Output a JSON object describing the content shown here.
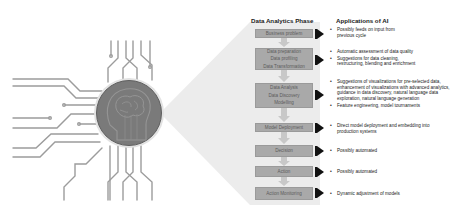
{
  "headers": {
    "phase": "Data Analytics Phase",
    "applications": "Applications of AI"
  },
  "phases": [
    {
      "lines": [
        "Business problem"
      ],
      "applications": [
        "Possibly feeds on input from previous cycle"
      ]
    },
    {
      "lines": [
        "Data preparation",
        "Data profiling",
        "Data Transformation"
      ],
      "applications": [
        "Automatic assessment of data quality",
        "Suggestions for data cleaning, restructuring, blending and enrichment"
      ]
    },
    {
      "lines": [
        "Data Analysis",
        "Data Discovery",
        "Modelling"
      ],
      "applications": [
        "Suggestions of visualizations for pre-selected data, enhancement of visualizations with advanced analytics, guidance in data discovery, natural language data exploration, natural language generation",
        "Feature engineering, model tournaments"
      ]
    },
    {
      "lines": [
        "Model Deployment"
      ],
      "applications": [
        "Direct model deployment and embedding into production systems"
      ]
    },
    {
      "lines": [
        "Decision"
      ],
      "applications": [
        "Possibly automated"
      ]
    },
    {
      "lines": [
        "Action"
      ],
      "applications": [
        "Possibly automated"
      ]
    },
    {
      "lines": [
        "Action Monitoring"
      ],
      "applications": [
        "Dynamic adjustment of models"
      ]
    }
  ],
  "illustration": {
    "subject": "AI brain head in circuit-board circle",
    "icon": "ai-brain-circuit-icon"
  },
  "colors": {
    "box_fill": "#a9a9a9",
    "box_text": "#5c5c5c",
    "fan_fill": "#ececec",
    "circle_fill": "#7a7a7a",
    "circuit_line": "#9c9c9c",
    "pointer": "#111111"
  }
}
